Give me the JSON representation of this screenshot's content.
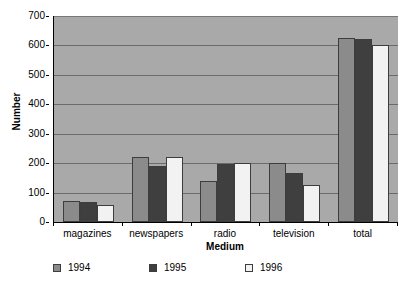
{
  "chart_data": {
    "type": "bar",
    "title": "",
    "subtitle": "",
    "xlabel": "Medium",
    "ylabel": "Number",
    "categories": [
      "magazines",
      "newspapers",
      "radio",
      "television",
      "total"
    ],
    "series": [
      {
        "name": "1994",
        "color": "#8b8b8b",
        "values": [
          72,
          220,
          138,
          199,
          625
        ]
      },
      {
        "name": "1995",
        "color": "#3f3f3f",
        "values": [
          68,
          190,
          196,
          168,
          622
        ]
      },
      {
        "name": "1996",
        "color": "#f2f2f2",
        "values": [
          57,
          222,
          199,
          127,
          603
        ]
      }
    ],
    "ylim": [
      0,
      700
    ],
    "ytick_step": 100,
    "yticks": [
      "0",
      "100",
      "200",
      "300",
      "400",
      "500",
      "600",
      "700"
    ],
    "grid": true,
    "grid_axis": "y",
    "legend_position": "bottom-left",
    "plot_background": "#a9a9a9",
    "gridline_color": "#6b6b6b",
    "axis_color": "#000000",
    "page_background": "#ffffff"
  },
  "axes": {
    "y_title": "Number",
    "x_title": "Medium"
  },
  "legend": {
    "items": [
      {
        "label": "1994"
      },
      {
        "label": "1995"
      },
      {
        "label": "1996"
      }
    ]
  }
}
